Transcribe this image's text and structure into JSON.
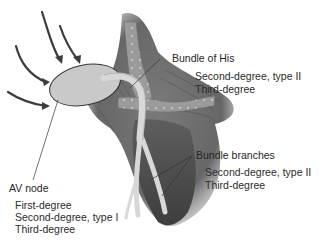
{
  "diagram": {
    "colors": {
      "tissue_dark": "#5a5a5a",
      "tissue_mid": "#8a8a8a",
      "conduction_path": "#d4d4d4",
      "av_node": "#c9c9c9",
      "arrow": "#3c3c3c",
      "leader_line": "#333333",
      "text": "#262626"
    },
    "labels": {
      "bundle_of_his": {
        "title": "Bundle of His",
        "items": [
          "Second-degree, type II",
          "Third-degree"
        ]
      },
      "av_node": {
        "title": "AV node",
        "items": [
          "First-degree",
          "Second-degree, type I",
          "Third-degree"
        ]
      },
      "bundle_branches": {
        "title": "Bundle branches",
        "items": [
          "Second-degree, type II",
          "Third-degree"
        ]
      }
    },
    "arrows": {
      "count": 4,
      "meaning": "impulses converging on AV node"
    }
  }
}
